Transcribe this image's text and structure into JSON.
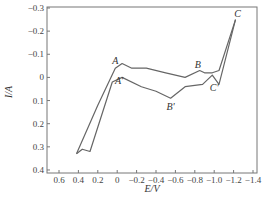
{
  "chart_data": {
    "type": "line",
    "title": "",
    "xlabel": "E/V",
    "ylabel": "I/A",
    "xlim": [
      0.7,
      -1.4
    ],
    "ylim": [
      0.4,
      -0.3
    ],
    "x_ticks": [
      "0.6",
      "0.4",
      "0.2",
      "0",
      "-0.2",
      "-0.4",
      "-0.6",
      "-0.8",
      "-1.0",
      "-1.2",
      "-1.4"
    ],
    "y_ticks": [
      "-0.3",
      "-0.2",
      "-0.1",
      "0",
      "0.1",
      "0.2",
      "0.3",
      "0.4"
    ],
    "grid": false,
    "legend": null,
    "series": [
      {
        "name": "forward scan (upper)",
        "points": [
          [
            0.42,
            0.33
          ],
          [
            0.2,
            0.12
          ],
          [
            0.02,
            -0.04
          ],
          [
            -0.05,
            -0.06
          ],
          [
            -0.15,
            -0.04
          ],
          [
            -0.3,
            -0.04
          ],
          [
            -0.5,
            -0.02
          ],
          [
            -0.7,
            0.0
          ],
          [
            -0.85,
            -0.03
          ],
          [
            -0.9,
            -0.02
          ],
          [
            -0.98,
            -0.02
          ],
          [
            -1.05,
            -0.03
          ],
          [
            -1.22,
            -0.25
          ]
        ]
      },
      {
        "name": "reverse scan (lower)",
        "points": [
          [
            -1.22,
            -0.25
          ],
          [
            -1.05,
            0.03
          ],
          [
            -0.98,
            -0.01
          ],
          [
            -0.88,
            0.03
          ],
          [
            -0.7,
            0.04
          ],
          [
            -0.55,
            0.09
          ],
          [
            -0.4,
            0.06
          ],
          [
            -0.25,
            0.04
          ],
          [
            -0.05,
            0.0
          ],
          [
            0.05,
            0.02
          ],
          [
            0.28,
            0.32
          ],
          [
            0.36,
            0.31
          ],
          [
            0.42,
            0.33
          ]
        ]
      }
    ],
    "annotations": [
      {
        "label": "A",
        "x": 0.02,
        "y": -0.06
      },
      {
        "label": "A'",
        "x": -0.02,
        "y": 0.03
      },
      {
        "label": "B",
        "x": -0.83,
        "y": -0.04
      },
      {
        "label": "B'",
        "x": -0.55,
        "y": 0.14
      },
      {
        "label": "C",
        "x": -1.24,
        "y": -0.26
      },
      {
        "label": "C'",
        "x": -1.0,
        "y": 0.06
      }
    ]
  }
}
